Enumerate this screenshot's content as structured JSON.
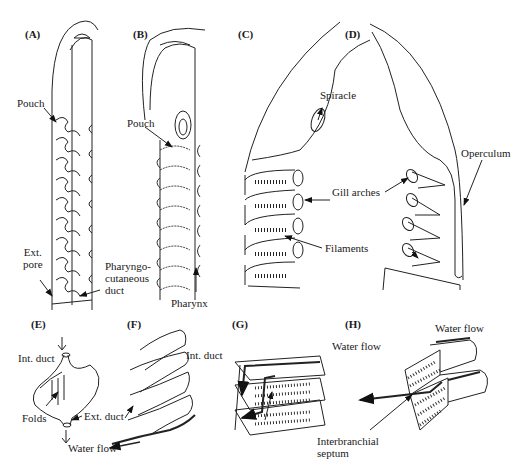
{
  "figure": {
    "panels": [
      {
        "id": "A",
        "label": "(A)"
      },
      {
        "id": "B",
        "label": "(B)"
      },
      {
        "id": "C",
        "label": "(C)"
      },
      {
        "id": "D",
        "label": "(D)"
      },
      {
        "id": "E",
        "label": "(E)"
      },
      {
        "id": "F",
        "label": "(F)"
      },
      {
        "id": "G",
        "label": "(G)"
      },
      {
        "id": "H",
        "label": "(H)"
      }
    ],
    "labels": {
      "a_pouch": "Pouch",
      "a_ext_pore": "Ext.\npore",
      "a_pharyngocutaneous_duct": "Pharyngo-\ncutaneous\nduct",
      "b_pouch": "Pouch",
      "b_pharynx": "Pharynx",
      "c_spiracle": "Spiracle",
      "cd_gill_arches": "Gill arches",
      "cd_filaments": "Filaments",
      "d_operculum": "Operculum",
      "e_int_duct": "Int. duct",
      "e_folds": "Folds",
      "e_ext_duct": "Ext. duct",
      "e_water_flow": "Water flow",
      "f_int_duct": "Int. duct",
      "g_water_flow": "Water flow",
      "g_interbranchial_septum": "Interbranchial\nseptum",
      "h_water_flow": "Water flow"
    }
  }
}
